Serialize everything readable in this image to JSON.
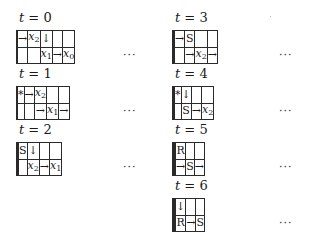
{
  "figure": {
    "panels": [
      {
        "label_var": "t",
        "label_eq": " = ",
        "label_val": "0",
        "column": "left",
        "rows": [
          [
            "",
            "→",
            "x2",
            "↓",
            "",
            ""
          ],
          [
            "",
            "",
            "",
            "x1",
            "→",
            "x0"
          ]
        ],
        "ellipsis": "···"
      },
      {
        "label_var": "t",
        "label_eq": " = ",
        "label_val": "1",
        "column": "left",
        "rows": [
          [
            "",
            "*",
            "→",
            "x2",
            "",
            ""
          ],
          [
            "",
            "",
            "",
            "→",
            "x1",
            "→"
          ]
        ],
        "ellipsis": "···"
      },
      {
        "label_var": "t",
        "label_eq": " = ",
        "label_val": "2",
        "column": "left",
        "rows": [
          [
            "",
            "",
            "S",
            "↓",
            "",
            ""
          ],
          [
            "",
            "",
            "",
            "x2",
            "→",
            "x1"
          ]
        ],
        "ellipsis": "···"
      },
      {
        "label_var": "t",
        "label_eq": " = ",
        "label_val": "3",
        "column": "right",
        "rows": [
          [
            "",
            "",
            "→",
            "S",
            "",
            ""
          ],
          [
            "",
            "",
            "",
            "→",
            "x2",
            "→"
          ]
        ],
        "ellipsis": "···"
      },
      {
        "label_var": "t",
        "label_eq": " = ",
        "label_val": "4",
        "column": "right",
        "rows": [
          [
            "",
            "",
            "*",
            "↓",
            "",
            ""
          ],
          [
            "",
            "",
            "",
            "S",
            "→",
            "x2"
          ]
        ],
        "ellipsis": "···"
      },
      {
        "label_var": "t",
        "label_eq": " = ",
        "label_val": "5",
        "column": "right",
        "rows": [
          [
            "",
            "",
            "",
            "R",
            "",
            ""
          ],
          [
            "",
            "",
            "",
            "→",
            "S",
            "→"
          ]
        ],
        "ellipsis": "···"
      },
      {
        "label_var": "t",
        "label_eq": " = ",
        "label_val": "6",
        "column": "right",
        "rows": [
          [
            "",
            "",
            "",
            "↓",
            "",
            ""
          ],
          [
            "",
            "",
            "",
            "R",
            "→",
            "S"
          ]
        ],
        "ellipsis": "···"
      }
    ]
  }
}
